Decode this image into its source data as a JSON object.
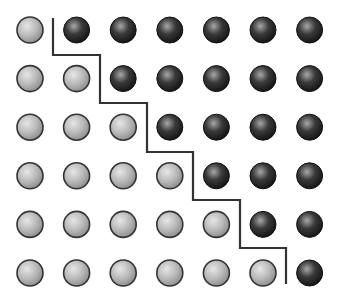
{
  "figure": {
    "rows": 6,
    "cols": 7,
    "grid": {
      "x0": 30,
      "y0": 30,
      "dx": 46.6,
      "dy": 48.6,
      "radius": 13
    },
    "colors": {
      "light_fill_highlight": "#e6e6e6",
      "light_fill_mid": "#b8b8b8",
      "light_fill_shadow": "#8a8a8a",
      "dark_fill_highlight": "#a8a8a8",
      "dark_fill_mid": "#3a3a3a",
      "dark_fill_shadow": "#111111",
      "outline": "#333333",
      "boundary_line": "#333333",
      "background": "#ffffff"
    },
    "cells": [
      [
        "light",
        "dark",
        "dark",
        "dark",
        "dark",
        "dark",
        "dark"
      ],
      [
        "light",
        "light",
        "dark",
        "dark",
        "dark",
        "dark",
        "dark"
      ],
      [
        "light",
        "light",
        "light",
        "dark",
        "dark",
        "dark",
        "dark"
      ],
      [
        "light",
        "light",
        "light",
        "light",
        "dark",
        "dark",
        "dark"
      ],
      [
        "light",
        "light",
        "light",
        "light",
        "light",
        "dark",
        "dark"
      ],
      [
        "light",
        "light",
        "light",
        "light",
        "light",
        "light",
        "dark"
      ]
    ],
    "boundary_points": [
      [
        53,
        18
      ],
      [
        53,
        55
      ],
      [
        100,
        55
      ],
      [
        100,
        103
      ],
      [
        147,
        103
      ],
      [
        147,
        152
      ],
      [
        193,
        152
      ],
      [
        193,
        200
      ],
      [
        240,
        200
      ],
      [
        240,
        248
      ],
      [
        286,
        248
      ],
      [
        286,
        284
      ]
    ]
  }
}
